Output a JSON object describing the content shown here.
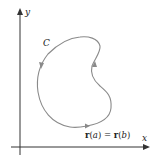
{
  "diagram": {
    "axes": {
      "x_label": "x",
      "y_label": "y"
    },
    "curve": {
      "label": "C",
      "closed": true,
      "orientation": "counterclockwise",
      "color": "#8a8a8a"
    },
    "start_end_point": {
      "vector_symbol": "r",
      "param_a": "a",
      "param_b": "b",
      "equation": "r(a) = r(b)"
    },
    "colors": {
      "axis": "#333333",
      "curve": "#8a8a8a",
      "text": "#222222",
      "background": "#ffffff"
    }
  }
}
